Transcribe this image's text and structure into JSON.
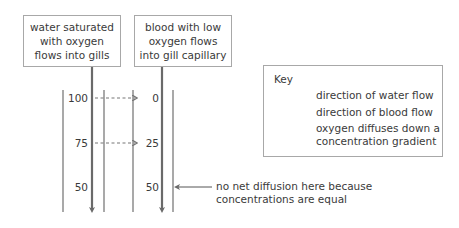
{
  "diagram": {
    "water_box": {
      "text": "water saturated with oxygen flows into gills"
    },
    "blood_box": {
      "text": "blood with low oxygen flows into gill capillary"
    },
    "rows": [
      {
        "water_value": "100",
        "blood_value": "0",
        "diffusion_arrow": true
      },
      {
        "water_value": "75",
        "blood_value": "25",
        "diffusion_arrow": true
      },
      {
        "water_value": "50",
        "blood_value": "50",
        "diffusion_arrow": false
      }
    ],
    "annotation": {
      "line1": "no net diffusion here because",
      "line2": "concentrations are equal"
    }
  },
  "key": {
    "title": "Key",
    "items": [
      {
        "icon": "solid-arrow-icon",
        "label": "direction of water flow"
      },
      {
        "icon": "solid-arrow-icon",
        "label": "direction of blood flow"
      },
      {
        "icon": "dashed-arrow-icon",
        "label_line1": "oxygen diffuses down a",
        "label_line2": "concentration gradient"
      }
    ]
  },
  "colors": {
    "line": "#6e6e6e",
    "arrow": "#707070",
    "border": "#a8a8a8",
    "text": "#3a3a3a"
  }
}
